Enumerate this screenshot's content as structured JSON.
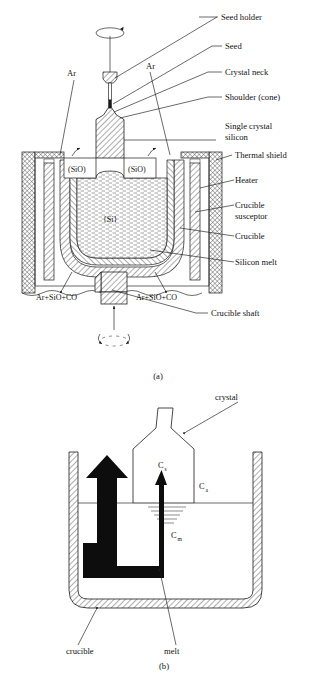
{
  "figure": {
    "panels": [
      {
        "id": "a",
        "caption": "(a)",
        "callouts_right": [
          "Seed holder",
          "Seed",
          "Crystal neck",
          "Shoulder (cone)",
          "Single crystal",
          "silicon",
          "Thermal shield",
          "Heater",
          "Crucible",
          "susceptor",
          "Crucible",
          "Silicon melt"
        ],
        "callouts_inner": {
          "ar_left": "Ar",
          "ar_right": "Ar",
          "sio_left": "(SiO)",
          "sio_right": "(SiO)",
          "melt_species": "{Si}",
          "gas_left": "Ar+SiO+CO",
          "gas_right": "Ar+SiO+CO",
          "shaft": "Crucible shaft"
        }
      },
      {
        "id": "b",
        "caption": "(b)",
        "callouts": {
          "crystal": "crystal",
          "crucible": "crucible",
          "melt": "melt"
        },
        "concentrations": [
          {
            "symbol": "C",
            "subscript": "s",
            "meaning": "crystal"
          },
          {
            "symbol": "C",
            "subscript": "a",
            "meaning": "ambient"
          },
          {
            "symbol": "C",
            "subscript": "m",
            "meaning": "melt"
          }
        ]
      }
    ],
    "colors": {
      "ink": "#1a1a1a",
      "paper": "#ffffff",
      "flow_arrow": "#0d0d0d"
    }
  }
}
